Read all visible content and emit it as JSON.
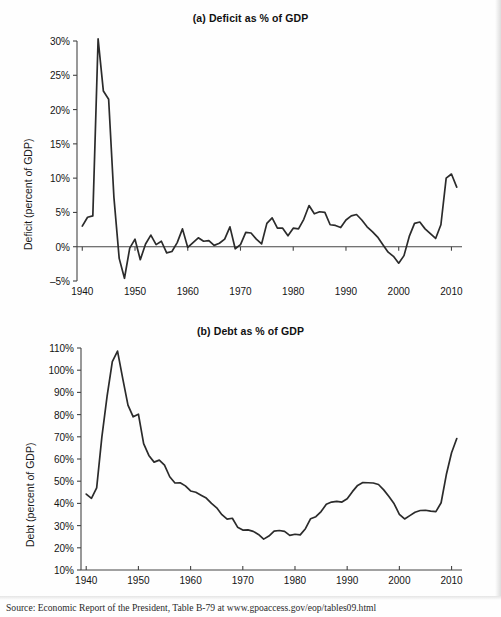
{
  "figure": {
    "source_note": "Source: Economic Report of the President, Table B-79 at www.gpoaccess.gov/eop/tables09.html",
    "line_color": "#2b2b2b",
    "axis_color": "#444444",
    "background": "#fefefe"
  },
  "chart_data": [
    {
      "type": "line",
      "panel": "a",
      "title": "(a) Deficit as % of GDP",
      "xlabel": "",
      "ylabel": "Deficit (percent of GDP)",
      "xlim": [
        1939,
        2012
      ],
      "ylim": [
        -5,
        30
      ],
      "xticks": [
        1940,
        1950,
        1960,
        1970,
        1980,
        1990,
        2000,
        2010
      ],
      "xticklabels": [
        "1940",
        "1950",
        "1960",
        "1970",
        "1980",
        "1990",
        "2000",
        "2010"
      ],
      "yticks": [
        -5,
        0,
        5,
        10,
        15,
        20,
        25,
        30
      ],
      "yticklabels": [
        "–5%",
        "0%",
        "5%",
        "10%",
        "15%",
        "20%",
        "25%",
        "30%"
      ],
      "grid": false,
      "zero_line": true,
      "legend": "none",
      "x": [
        1940,
        1941,
        1942,
        1943,
        1944,
        1945,
        1946,
        1947,
        1948,
        1949,
        1950,
        1951,
        1952,
        1953,
        1954,
        1955,
        1956,
        1957,
        1958,
        1959,
        1960,
        1961,
        1962,
        1963,
        1964,
        1965,
        1966,
        1967,
        1968,
        1969,
        1970,
        1971,
        1972,
        1973,
        1974,
        1975,
        1976,
        1977,
        1978,
        1979,
        1980,
        1981,
        1982,
        1983,
        1984,
        1985,
        1986,
        1987,
        1988,
        1989,
        1990,
        1991,
        1992,
        1993,
        1994,
        1995,
        1996,
        1997,
        1998,
        1999,
        2000,
        2001,
        2002,
        2003,
        2004,
        2005,
        2006,
        2007,
        2008,
        2009,
        2010,
        2011
      ],
      "values": [
        3.0,
        4.3,
        4.5,
        30.3,
        22.7,
        21.5,
        7.2,
        -1.7,
        -4.6,
        -0.2,
        1.1,
        -1.9,
        0.4,
        1.7,
        0.3,
        0.8,
        -0.9,
        -0.7,
        0.6,
        2.6,
        -0.1,
        0.6,
        1.3,
        0.8,
        0.9,
        0.2,
        0.5,
        1.1,
        2.9,
        -0.3,
        0.3,
        2.1,
        2.0,
        1.1,
        0.4,
        3.4,
        4.2,
        2.7,
        2.7,
        1.6,
        2.7,
        2.6,
        4.0,
        6.0,
        4.8,
        5.1,
        5.0,
        3.2,
        3.1,
        2.8,
        3.9,
        4.5,
        4.7,
        3.9,
        2.9,
        2.2,
        1.4,
        0.3,
        -0.8,
        -1.4,
        -2.4,
        -1.3,
        1.5,
        3.4,
        3.6,
        2.6,
        1.9,
        1.2,
        3.2,
        10.0,
        10.6,
        8.7
      ]
    },
    {
      "type": "line",
      "panel": "b",
      "title": "(b) Debt as % of GDP",
      "xlabel": "",
      "ylabel": "Debt (percent of GDP)",
      "xlim": [
        1939,
        2012
      ],
      "ylim": [
        10,
        110
      ],
      "xticks": [
        1940,
        1950,
        1960,
        1970,
        1980,
        1990,
        2000,
        2010
      ],
      "xticklabels": [
        "1940",
        "1950",
        "1960",
        "1970",
        "1980",
        "1990",
        "2000",
        "2010"
      ],
      "yticks": [
        10,
        20,
        30,
        40,
        50,
        60,
        70,
        80,
        90,
        100,
        110
      ],
      "yticklabels": [
        "10%",
        "20%",
        "30%",
        "40%",
        "50%",
        "60%",
        "70%",
        "80%",
        "90%",
        "100%",
        "110%"
      ],
      "grid": false,
      "zero_line": false,
      "legend": "none",
      "x": [
        1940,
        1941,
        1942,
        1943,
        1944,
        1945,
        1946,
        1947,
        1948,
        1949,
        1950,
        1951,
        1952,
        1953,
        1954,
        1955,
        1956,
        1957,
        1958,
        1959,
        1960,
        1961,
        1962,
        1963,
        1964,
        1965,
        1966,
        1967,
        1968,
        1969,
        1970,
        1971,
        1972,
        1973,
        1974,
        1975,
        1976,
        1977,
        1978,
        1979,
        1980,
        1981,
        1982,
        1983,
        1984,
        1985,
        1986,
        1987,
        1988,
        1989,
        1990,
        1991,
        1992,
        1993,
        1994,
        1995,
        1996,
        1997,
        1998,
        1999,
        2000,
        2001,
        2002,
        2003,
        2004,
        2005,
        2006,
        2007,
        2008,
        2009,
        2010,
        2011
      ],
      "values": [
        44.2,
        42.3,
        47.0,
        70.0,
        88.3,
        103.9,
        108.6,
        96.2,
        84.3,
        79.0,
        80.2,
        66.9,
        61.6,
        58.6,
        59.5,
        57.2,
        52.0,
        49.2,
        49.3,
        47.9,
        45.6,
        45.0,
        43.7,
        42.4,
        40.0,
        38.0,
        34.9,
        32.9,
        33.3,
        29.3,
        28.0,
        28.1,
        27.4,
        26.0,
        23.9,
        25.3,
        27.5,
        27.8,
        27.4,
        25.6,
        26.1,
        25.8,
        28.6,
        33.1,
        34.0,
        36.3,
        39.6,
        40.6,
        40.9,
        40.6,
        42.1,
        45.3,
        48.1,
        49.4,
        49.3,
        49.2,
        48.5,
        46.1,
        43.1,
        39.8,
        35.1,
        33.0,
        34.5,
        36.0,
        36.8,
        36.9,
        36.5,
        36.3,
        40.3,
        53.0,
        62.8,
        69.2
      ]
    }
  ]
}
